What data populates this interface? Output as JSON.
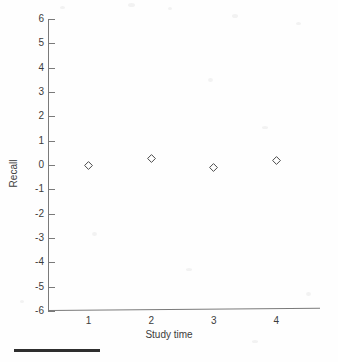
{
  "chart_data": {
    "type": "scatter",
    "title": "",
    "xlabel": "Study time",
    "ylabel": "Recall",
    "x": [
      1,
      2,
      3,
      4
    ],
    "values": [
      0.0,
      0.25,
      -0.1,
      0.2
    ],
    "categories": [
      "1",
      "2",
      "3",
      "4"
    ],
    "xtick_labels": [
      "1",
      "2",
      "3",
      "4"
    ],
    "ytick_labels": [
      "6",
      "5",
      "4",
      "3",
      "2",
      "1",
      "0",
      "-1",
      "-2",
      "-3",
      "-4",
      "-5",
      "-6"
    ],
    "ytick_values": [
      6,
      5,
      4,
      3,
      2,
      1,
      0,
      -1,
      -2,
      -3,
      -4,
      -5,
      -6
    ],
    "ylim": [
      -6,
      6
    ],
    "xlim": [
      0.35,
      4.7
    ],
    "grid": false,
    "legend": null,
    "marker_style": "open-diamond",
    "series": [
      {
        "name": "Recall by study time",
        "points": [
          {
            "x": 1,
            "y": 0.0
          },
          {
            "x": 2,
            "y": 0.25
          },
          {
            "x": 3,
            "y": -0.1
          },
          {
            "x": 4,
            "y": 0.2
          }
        ]
      }
    ],
    "colors": {
      "axis": "#7a7a7a",
      "text": "#3c3c3c",
      "marker_stroke": "#4a4a4a",
      "background": "#fefefe",
      "footer_rule": "#2e2e2e"
    }
  },
  "footer": {
    "rule_label": "horizontal-rule"
  }
}
